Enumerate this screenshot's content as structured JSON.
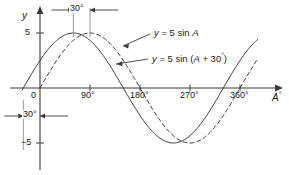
{
  "figure": {
    "title": "",
    "background": "#ffffff",
    "ink": "#3a3a3a",
    "text_color": "#1a1a1a"
  },
  "axes": {
    "y_axis_label": "y",
    "x_axis_label": "A",
    "x_axis_label_sup": "°",
    "y_ticks": [
      {
        "label": "5",
        "value": 5
      },
      {
        "label": "−5",
        "value": -5
      }
    ],
    "x_ticks": [
      {
        "label": "0",
        "value": 0
      },
      {
        "label": "90°",
        "value": 90
      },
      {
        "label": "180°",
        "value": 180
      },
      {
        "label": "270°",
        "value": 270
      },
      {
        "label": "360°",
        "value": 360
      }
    ],
    "xlim": [
      -60,
      390
    ],
    "ylim": [
      -7.2,
      7.2
    ],
    "origin_label": "0"
  },
  "annotations": {
    "top_dimension": {
      "label": "30°",
      "from_value": 60,
      "to_value": 90,
      "description": "phase shift between peaks"
    },
    "bottom_dimension": {
      "label": "30°",
      "from_value": -30,
      "to_value": 0,
      "description": "phase shift at zero crossing"
    },
    "curve_label_1": "y = 5 sin A",
    "curve_label_2": "y = 5 sin (A + 30°)"
  },
  "chart_data": {
    "type": "line",
    "title": "",
    "xlabel": "A°",
    "ylabel": "y",
    "xlim": [
      -60,
      390
    ],
    "ylim": [
      -7.2,
      7.2
    ],
    "grid": false,
    "legend": "inline-labels",
    "x_ticks": [
      0,
      90,
      180,
      270,
      360
    ],
    "x_tick_labels": [
      "0",
      "90°",
      "180°",
      "270°",
      "360°"
    ],
    "y_ticks": [
      5,
      -5
    ],
    "y_tick_labels": [
      "5",
      "−5"
    ],
    "series": [
      {
        "name": "y = 5 sin A",
        "style": "dashed",
        "amplitude": 5,
        "phase_deg": 0,
        "formula": "y = 5*sin(A)",
        "key_points": [
          {
            "x": 0,
            "y": 0
          },
          {
            "x": 90,
            "y": 5
          },
          {
            "x": 180,
            "y": 0
          },
          {
            "x": 270,
            "y": -5
          },
          {
            "x": 360,
            "y": 0
          }
        ]
      },
      {
        "name": "y = 5 sin (A + 30°)",
        "style": "solid",
        "amplitude": 5,
        "phase_deg": 30,
        "formula": "y = 5*sin(A + 30)",
        "key_points": [
          {
            "x": -30,
            "y": 0
          },
          {
            "x": 0,
            "y": 2.5
          },
          {
            "x": 60,
            "y": 5
          },
          {
            "x": 150,
            "y": 0
          },
          {
            "x": 240,
            "y": -5
          },
          {
            "x": 330,
            "y": 0
          },
          {
            "x": 390,
            "y": 4.33
          }
        ]
      }
    ]
  }
}
